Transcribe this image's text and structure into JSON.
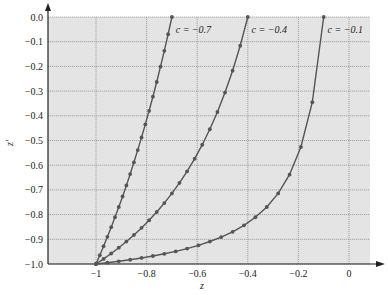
{
  "chart_data": {
    "type": "line",
    "title": "",
    "xlabel": "z",
    "ylabel": "z'",
    "xlim": [
      -1.19,
      0.08
    ],
    "ylim": [
      -1.0,
      0.0
    ],
    "grid": true,
    "background": "#e4e4e4",
    "line_color": "#555555",
    "xticks": [
      -1,
      -0.8,
      -0.6,
      -0.4,
      -0.2,
      0
    ],
    "xtick_labels": [
      "−1",
      "−0.8",
      "−0.6",
      "−0.4",
      "−0.2",
      "0"
    ],
    "yticks": [
      0.0,
      -0.1,
      -0.2,
      -0.3,
      -0.4,
      -0.5,
      -0.6,
      -0.7,
      -0.8,
      -0.9,
      -1.0
    ],
    "ytick_labels": [
      "0.0",
      "−0.1",
      "−0.2",
      "−0.3",
      "−0.4",
      "−0.5",
      "−0.6",
      "−0.7",
      "−0.8",
      "−0.9",
      "−1.0"
    ],
    "series": [
      {
        "name": "c = −0.7",
        "label_pos": [
          -0.685,
          -0.05
        ],
        "x": [
          -1,
          -0.985,
          -0.97,
          -0.955,
          -0.94,
          -0.925,
          -0.91,
          -0.895,
          -0.88,
          -0.865,
          -0.85,
          -0.835,
          -0.82,
          -0.805,
          -0.79,
          -0.775,
          -0.76,
          -0.745,
          -0.73,
          -0.715,
          -0.7
        ],
        "y": [
          -1,
          -0.9645,
          -0.9278,
          -0.89,
          -0.851,
          -0.8108,
          -0.7692,
          -0.7263,
          -0.6818,
          -0.6358,
          -0.5882,
          -0.5389,
          -0.4878,
          -0.4348,
          -0.3798,
          -0.3226,
          -0.2632,
          -0.2013,
          -0.137,
          -0.0699,
          0
        ]
      },
      {
        "name": "c = −0.4",
        "label_pos": [
          -0.385,
          -0.05
        ],
        "x": [
          -1,
          -0.97,
          -0.94,
          -0.91,
          -0.88,
          -0.85,
          -0.82,
          -0.79,
          -0.76,
          -0.73,
          -0.7,
          -0.67,
          -0.64,
          -0.61,
          -0.58,
          -0.55,
          -0.52,
          -0.49,
          -0.46,
          -0.43,
          -0.4
        ],
        "y": [
          -1,
          -0.9794,
          -0.9575,
          -0.9341,
          -0.9091,
          -0.8824,
          -0.8537,
          -0.8228,
          -0.7895,
          -0.7534,
          -0.7143,
          -0.6717,
          -0.625,
          -0.5738,
          -0.5172,
          -0.4545,
          -0.3846,
          -0.3061,
          -0.2174,
          -0.1163,
          0
        ]
      },
      {
        "name": "c = −0.1",
        "label_pos": [
          -0.085,
          -0.05
        ],
        "x": [
          -1,
          -0.955,
          -0.91,
          -0.865,
          -0.82,
          -0.775,
          -0.73,
          -0.685,
          -0.64,
          -0.595,
          -0.55,
          -0.505,
          -0.46,
          -0.415,
          -0.37,
          -0.325,
          -0.28,
          -0.235,
          -0.19,
          -0.145,
          -0.1
        ],
        "y": [
          -1,
          -0.9948,
          -0.989,
          -0.9827,
          -0.9756,
          -0.9677,
          -0.9589,
          -0.9489,
          -0.9375,
          -0.9244,
          -0.9091,
          -0.8911,
          -0.8696,
          -0.8434,
          -0.8108,
          -0.7692,
          -0.7143,
          -0.6383,
          -0.5263,
          -0.3448,
          0
        ]
      }
    ]
  }
}
